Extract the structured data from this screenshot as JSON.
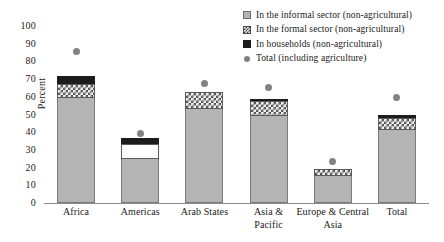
{
  "chart_data": {
    "type": "bar",
    "title": "",
    "subtitle": "",
    "xlabel": "",
    "ylabel": "Percent",
    "ylim": [
      0,
      100
    ],
    "yticks": [
      0,
      10,
      20,
      30,
      40,
      50,
      60,
      70,
      80,
      90,
      100
    ],
    "grid": false,
    "stacked": true,
    "legend_position": "top-right",
    "categories": [
      "Africa",
      "Americas",
      "Arab States",
      "Asia & Pacific",
      "Europe & Central Asia",
      "Total"
    ],
    "series": [
      {
        "name": "In the informal sector (non-agricultural)",
        "type": "bar-segment",
        "color": "#b4b4b4",
        "pattern": "solid-gray",
        "values": [
          59.5,
          25.0,
          53.0,
          49.0,
          15.0,
          41.0
        ]
      },
      {
        "name": "In the formal sector (non-agricultural)",
        "type": "bar-segment",
        "color": "#eeeeee",
        "pattern": "checkered",
        "values": [
          8.0,
          8.5,
          10.0,
          8.5,
          4.0,
          7.0
        ]
      },
      {
        "name": "In households (non-agricultural)",
        "type": "bar-segment",
        "color": "#1c1c1c",
        "pattern": "solid-black",
        "values": [
          4.5,
          3.0,
          0.0,
          1.5,
          0.0,
          2.0
        ]
      },
      {
        "name": "Total (including agriculture)",
        "type": "marker",
        "color": "#828282",
        "pattern": "dot",
        "values": [
          86.0,
          40.0,
          68.0,
          66.0,
          24.0,
          60.0
        ]
      }
    ],
    "stack_totals": [
      72.0,
      36.5,
      63.0,
      59.0,
      19.0,
      50.0
    ]
  },
  "legend": {
    "items": [
      {
        "label": "In the informal sector (non-agricultural)",
        "swatch": "informal-swatch-icon"
      },
      {
        "label": "In the formal sector (non-agricultural)",
        "swatch": "formal-swatch-icon"
      },
      {
        "label": "In households (non-agricultural)",
        "swatch": "household-swatch-icon"
      },
      {
        "label": "Total (including agriculture)",
        "swatch": "total-dot-icon"
      }
    ]
  },
  "axes": {
    "y_label": "Percent",
    "y_ticks": [
      "100",
      "90",
      "80",
      "70",
      "60",
      "50",
      "40",
      "30",
      "20",
      "10",
      "0"
    ],
    "x_labels": [
      "Africa",
      "Americas",
      "Arab States",
      "Europe & Central",
      "Total"
    ],
    "x_label_asia_line1": "Asia &",
    "x_label_asia_line2": "Pacific",
    "x_label_europe_line1": "Europe & Central",
    "x_label_europe_line2": "Asia"
  },
  "colors": {
    "informal": "#b4b4b4",
    "formal": "#eeeeee",
    "households": "#1c1c1c",
    "total_dot": "#828282",
    "axis": "#8a8a8a",
    "text": "#1a1a1a",
    "background": "#ffffff"
  }
}
